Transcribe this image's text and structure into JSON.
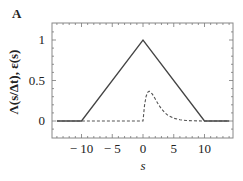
{
  "panel": {
    "label": "A"
  },
  "chart_data": {
    "type": "line",
    "title": "",
    "xlabel": "s",
    "ylabel": "Λ(s/Δt), ε(s)",
    "xlim": [
      -15,
      14.5
    ],
    "ylim": [
      -0.15,
      1.18
    ],
    "xticks": [
      -10,
      -5,
      0,
      5,
      10
    ],
    "xtick_labels": [
      "− 10",
      "− 5",
      "0",
      "5",
      "10"
    ],
    "yticks": [
      0,
      0.5,
      1
    ],
    "ytick_labels": [
      "0",
      "0.5",
      "1"
    ],
    "grid": false,
    "legend": null,
    "series": [
      {
        "name": "Λ(s/Δt)",
        "style": "solid",
        "color": "#444444",
        "x": [
          -14,
          -10,
          0,
          10,
          14
        ],
        "y": [
          0,
          0,
          1,
          0,
          0
        ]
      },
      {
        "name": "ε(s)",
        "style": "dashed",
        "color": "#555555",
        "x": [
          -14,
          -10,
          -5,
          0,
          0.25,
          0.5,
          0.75,
          1,
          1.5,
          2,
          2.5,
          3,
          3.5,
          4,
          5,
          6,
          7,
          8,
          10,
          12,
          14
        ],
        "y": [
          0,
          0,
          0,
          0,
          0.195,
          0.303,
          0.354,
          0.368,
          0.335,
          0.271,
          0.205,
          0.149,
          0.106,
          0.073,
          0.034,
          0.015,
          0.006,
          0.003,
          0.0,
          0.0,
          0.0
        ]
      }
    ]
  }
}
